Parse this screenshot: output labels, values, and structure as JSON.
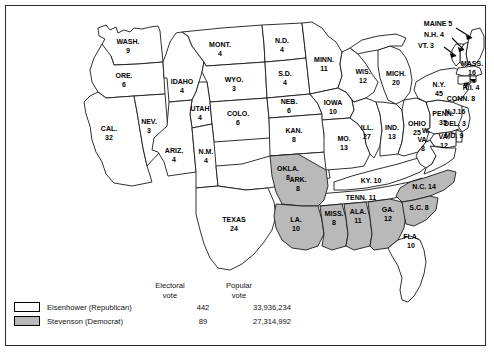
{
  "map": {
    "title": "Presidential election map of 1952",
    "colors": {
      "republican_fill": "#ffffff",
      "democrat_fill": "#b9b9b9",
      "outline": "#1a1a1a",
      "frame": "#2b2b2b"
    },
    "states": [
      {
        "abbr": "WASH.",
        "votes": "9",
        "winner": "republican"
      },
      {
        "abbr": "ORE.",
        "votes": "6",
        "winner": "republican"
      },
      {
        "abbr": "CAL.",
        "votes": "32",
        "winner": "republican"
      },
      {
        "abbr": "NEV.",
        "votes": "3",
        "winner": "republican"
      },
      {
        "abbr": "IDAHO",
        "votes": "4",
        "winner": "republican"
      },
      {
        "abbr": "MONT.",
        "votes": "4",
        "winner": "republican"
      },
      {
        "abbr": "WYO.",
        "votes": "3",
        "winner": "republican"
      },
      {
        "abbr": "UTAH",
        "votes": "4",
        "winner": "republican"
      },
      {
        "abbr": "ARIZ.",
        "votes": "4",
        "winner": "republican"
      },
      {
        "abbr": "COLO.",
        "votes": "6",
        "winner": "republican"
      },
      {
        "abbr": "N.M.",
        "votes": "4",
        "winner": "republican"
      },
      {
        "abbr": "N.D.",
        "votes": "4",
        "winner": "republican"
      },
      {
        "abbr": "S.D.",
        "votes": "4",
        "winner": "republican"
      },
      {
        "abbr": "NEB.",
        "votes": "6",
        "winner": "republican"
      },
      {
        "abbr": "KAN.",
        "votes": "8",
        "winner": "republican"
      },
      {
        "abbr": "OKLA.",
        "votes": "8",
        "winner": "republican"
      },
      {
        "abbr": "TEXAS",
        "votes": "24",
        "winner": "republican"
      },
      {
        "abbr": "MINN.",
        "votes": "11",
        "winner": "republican"
      },
      {
        "abbr": "IOWA",
        "votes": "10",
        "winner": "republican"
      },
      {
        "abbr": "MO.",
        "votes": "13",
        "winner": "republican"
      },
      {
        "abbr": "WIS.",
        "votes": "12",
        "winner": "republican"
      },
      {
        "abbr": "ILL.",
        "votes": "27",
        "winner": "republican"
      },
      {
        "abbr": "MICH.",
        "votes": "20",
        "winner": "republican"
      },
      {
        "abbr": "IND.",
        "votes": "13",
        "winner": "republican"
      },
      {
        "abbr": "OHIO",
        "votes": "25",
        "winner": "republican"
      },
      {
        "abbr": "KY.",
        "votes": "10",
        "winner": "republican"
      },
      {
        "abbr": "TENN.",
        "votes": "11",
        "winner": "republican"
      },
      {
        "abbr": "FLA.",
        "votes": "10",
        "winner": "republican"
      },
      {
        "abbr": "PENN.",
        "votes": "35",
        "winner": "republican"
      },
      {
        "abbr": "N.Y.",
        "votes": "45",
        "winner": "republican"
      },
      {
        "abbr": "MAINE",
        "votes": "5",
        "winner": "republican"
      },
      {
        "abbr": "N.H.",
        "votes": "4",
        "winner": "republican"
      },
      {
        "abbr": "VT.",
        "votes": "3",
        "winner": "republican"
      },
      {
        "abbr": "MASS.",
        "votes": "16",
        "winner": "republican"
      },
      {
        "abbr": "R.I.",
        "votes": "4",
        "winner": "republican"
      },
      {
        "abbr": "CONN.",
        "votes": "8",
        "winner": "republican"
      },
      {
        "abbr": "N.J.",
        "votes": "16",
        "winner": "republican"
      },
      {
        "abbr": "DEL.",
        "votes": "3",
        "winner": "republican"
      },
      {
        "abbr": "MD.",
        "votes": "9",
        "winner": "republican"
      },
      {
        "abbr": "W. VA.",
        "votes": "8",
        "winner": "republican"
      },
      {
        "abbr": "VA.",
        "votes": "12",
        "winner": "republican"
      },
      {
        "abbr": "ARK.",
        "votes": "8",
        "winner": "democrat"
      },
      {
        "abbr": "LA.",
        "votes": "10",
        "winner": "democrat"
      },
      {
        "abbr": "MISS.",
        "votes": "8",
        "winner": "democrat"
      },
      {
        "abbr": "ALA.",
        "votes": "11",
        "winner": "democrat"
      },
      {
        "abbr": "GA.",
        "votes": "12",
        "winner": "democrat"
      },
      {
        "abbr": "N.C.",
        "votes": "14",
        "winner": "democrat"
      },
      {
        "abbr": "S.C.",
        "votes": "8",
        "winner": "democrat"
      }
    ],
    "labels": {
      "wash": "WASH.",
      "wash_v": "9",
      "ore": "ORE.",
      "ore_v": "6",
      "cal": "CAL.",
      "cal_v": "32",
      "nev": "NEV.",
      "nev_v": "3",
      "idaho": "IDAHO",
      "idaho_v": "4",
      "mont": "MONT.",
      "mont_v": "4",
      "wyo": "WYO.",
      "wyo_v": "3",
      "utah": "UTAH",
      "utah_v": "4",
      "ariz": "ARIZ.",
      "ariz_v": "4",
      "colo": "COLO.",
      "colo_v": "6",
      "nm": "N.M.",
      "nm_v": "4",
      "nd": "N.D.",
      "nd_v": "4",
      "sd": "S.D.",
      "sd_v": "4",
      "neb": "NEB.",
      "neb_v": "6",
      "kan": "KAN.",
      "kan_v": "8",
      "okla": "OKLA.",
      "okla_v": "8",
      "texas": "TEXAS",
      "texas_v": "24",
      "minn": "MINN.",
      "minn_v": "11",
      "iowa": "IOWA",
      "iowa_v": "10",
      "mo": "MO.",
      "mo_v": "13",
      "wis": "WIS.",
      "wis_v": "12",
      "ill": "ILL.",
      "ill_v": "27",
      "mich": "MICH.",
      "mich_v": "20",
      "ind": "IND.",
      "ind_v": "13",
      "ohio": "OHIO",
      "ohio_v": "25",
      "ky": "KY. 10",
      "tenn": "TENN. 11",
      "fla": "FLA.",
      "fla_v": "10",
      "penn": "PENN.",
      "penn_v": "35",
      "ny": "N.Y.",
      "ny_v": "45",
      "maine": "MAINE 5",
      "nh": "N.H. 4",
      "vt": "VT. 3",
      "mass": "MASS.",
      "mass_v": "16",
      "ri": "R.I. 4",
      "conn": "CONN. 8",
      "nj": "N.J.16",
      "del": "DEL. 3",
      "md": "MD. 9",
      "wva1": "W.",
      "wva2": "VA.",
      "wva3": "8",
      "va": "VA.",
      "va_v": "12",
      "ark": "ARK.",
      "ark_v": "8",
      "la": "LA.",
      "la_v": "10",
      "miss": "MISS.",
      "miss_v": "8",
      "ala": "ALA.",
      "ala_v": "11",
      "ga": "GA.",
      "ga_v": "12",
      "nc": "N.C. 14",
      "sc": "S.C. 8"
    }
  },
  "legend": {
    "header_electoral_1": "Electoral",
    "header_electoral_2": "vote",
    "header_popular_1": "Popular",
    "header_popular_2": "vote",
    "rows": [
      {
        "name": "Eisenhower (Republican)",
        "electoral": "442",
        "popular": "33,936,234",
        "swatch": "white"
      },
      {
        "name": "Stevenson (Democrat)",
        "electoral": "89",
        "popular": "27,314,992",
        "swatch": "gray"
      }
    ]
  }
}
